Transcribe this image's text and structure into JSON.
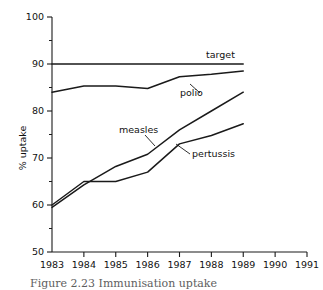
{
  "figure": {
    "caption": "Figure 2.23  Immunisation uptake"
  },
  "chart_data": {
    "type": "line",
    "title": "",
    "xlabel": "",
    "ylabel": "% uptake",
    "x": [
      1983,
      1984,
      1985,
      1986,
      1987,
      1988,
      1989
    ],
    "xticklabels": [
      "1983",
      "1984",
      "1985",
      "1986",
      "1987",
      "1988",
      "1989",
      "1990",
      "1991"
    ],
    "xticks": [
      1983,
      1984,
      1985,
      1986,
      1987,
      1988,
      1989,
      1990,
      1991
    ],
    "xlim": [
      1983,
      1991
    ],
    "ylim": [
      50,
      100
    ],
    "yticks": [
      50,
      60,
      70,
      80,
      90,
      100
    ],
    "yticklabels": [
      "50",
      "60",
      "70",
      "80",
      "90",
      "100"
    ],
    "yminorticks": [
      55,
      65,
      75,
      85,
      95
    ],
    "grid": false,
    "legend": "inline-labels",
    "line_color": "#1a1a1a",
    "series": [
      {
        "name": "target",
        "label": "target",
        "values": [
          90,
          90,
          90,
          90,
          90,
          90,
          90
        ]
      },
      {
        "name": "polio",
        "label": "polio",
        "values": [
          84.0,
          85.3,
          85.3,
          84.8,
          87.3,
          87.8,
          88.5
        ]
      },
      {
        "name": "measles",
        "label": "measles",
        "values": [
          59.5,
          64.3,
          68.2,
          70.8,
          76.0,
          80.0,
          84.0
        ]
      },
      {
        "name": "pertussis",
        "label": "pertussis",
        "values": [
          60.0,
          65.0,
          65.0,
          67.0,
          73.0,
          74.8,
          77.3
        ]
      }
    ]
  }
}
